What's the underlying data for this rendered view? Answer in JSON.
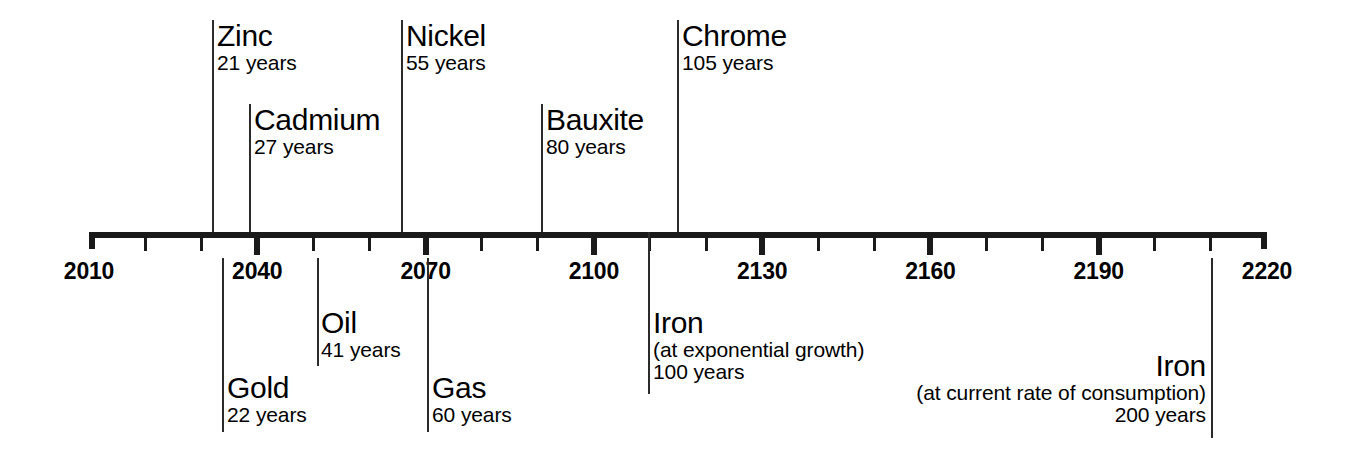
{
  "chart_data": {
    "type": "timeline",
    "title": "",
    "subtitle": "",
    "xlabel": "",
    "ylabel": "",
    "xlim": [
      2010,
      2220
    ],
    "base_year": 2010,
    "grid": false,
    "legend": false,
    "axis": {
      "start_label": "2010",
      "end_label": "2220",
      "major_tick_step": 30,
      "minor_tick_step": 10,
      "tick_labels": [
        "2010",
        "2040",
        "2070",
        "2100",
        "2130",
        "2160",
        "2190",
        "2220"
      ],
      "tick_years": [
        2010,
        2040,
        2070,
        2100,
        2130,
        2160,
        2190,
        2220
      ],
      "minor_tick_years": [
        2020,
        2030,
        2050,
        2060,
        2080,
        2090,
        2110,
        2120,
        2140,
        2150,
        2170,
        2180,
        2200,
        2210
      ]
    },
    "categories": [
      "Zinc",
      "Gold",
      "Cadmium",
      "Oil",
      "Nickel",
      "Gas",
      "Bauxite",
      "Iron (at exponential growth)",
      "Chrome",
      "Iron (at current rate of consumption)"
    ],
    "values": [
      21,
      22,
      27,
      41,
      55,
      60,
      80,
      100,
      105,
      200
    ],
    "units": "years",
    "markers": [
      {
        "id": "zinc",
        "name": "Zinc",
        "note": "",
        "years_text": "21 years",
        "years": 21,
        "side": "above",
        "align": "left",
        "label_x": 217,
        "label_y": 20,
        "line_x": 212,
        "line_top": 20,
        "line_bottom": 232
      },
      {
        "id": "cadmium",
        "name": "Cadmium",
        "note": "",
        "years_text": "27 years",
        "years": 27,
        "side": "above",
        "align": "left",
        "label_x": 254,
        "label_y": 104,
        "line_x": 249,
        "line_top": 104,
        "line_bottom": 232
      },
      {
        "id": "nickel",
        "name": "Nickel",
        "note": "",
        "years_text": "55 years",
        "years": 55,
        "side": "above",
        "align": "left",
        "label_x": 406,
        "label_y": 20,
        "line_x": 401,
        "line_top": 20,
        "line_bottom": 232
      },
      {
        "id": "bauxite",
        "name": "Bauxite",
        "note": "",
        "years_text": "80 years",
        "years": 80,
        "side": "above",
        "align": "left",
        "label_x": 546,
        "label_y": 104,
        "line_x": 541,
        "line_top": 104,
        "line_bottom": 232
      },
      {
        "id": "chrome",
        "name": "Chrome",
        "note": "",
        "years_text": "105 years",
        "years": 105,
        "side": "above",
        "align": "left",
        "label_x": 682,
        "label_y": 20,
        "line_x": 677,
        "line_top": 20,
        "line_bottom": 232
      },
      {
        "id": "oil",
        "name": "Oil",
        "note": "",
        "years_text": "41 years",
        "years": 41,
        "side": "below",
        "align": "left",
        "label_x": 321,
        "label_y": 307,
        "line_x": 317,
        "line_top": 258,
        "line_bottom": 366
      },
      {
        "id": "gold",
        "name": "Gold",
        "note": "",
        "years_text": "22 years",
        "years": 22,
        "side": "below",
        "align": "left",
        "label_x": 227,
        "label_y": 372,
        "line_x": 222,
        "line_top": 258,
        "line_bottom": 432
      },
      {
        "id": "gas",
        "name": "Gas",
        "note": "",
        "years_text": "60 years",
        "years": 60,
        "side": "below",
        "align": "left",
        "label_x": 432,
        "label_y": 372,
        "line_x": 427,
        "line_top": 258,
        "line_bottom": 432
      },
      {
        "id": "iron-exponential",
        "name": "Iron",
        "note": "(at exponential growth)",
        "years_text": "100 years",
        "years": 100,
        "side": "below",
        "align": "left",
        "label_x": 653,
        "label_y": 307,
        "line_x": 648,
        "line_top": 232,
        "line_bottom": 394
      },
      {
        "id": "iron-current",
        "name": "Iron",
        "note": "(at current rate of consumption)",
        "years_text": "200 years",
        "years": 200,
        "side": "below",
        "align": "right",
        "label_x": 1206,
        "label_y": 350,
        "line_x": 1211,
        "line_top": 258,
        "line_bottom": 438
      }
    ]
  }
}
